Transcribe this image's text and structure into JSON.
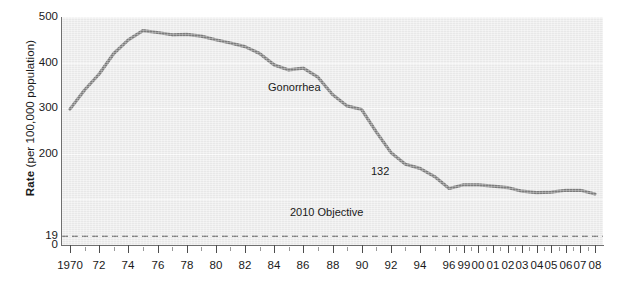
{
  "axes": {
    "y_title_bold": "Rate",
    "y_title_rest": " (per 100,000 population)"
  },
  "annotations": {
    "series_label": "Gonorrhea",
    "point_label": "132",
    "objective_label": "2010 Objective"
  },
  "colors": {
    "line": "#7d7d7d",
    "plot_background": "#eeeeee",
    "gridline": "#fbfbfb",
    "axis": "#6f6f6f",
    "text": "#1a1a1a",
    "objective_line": "#4d4d4d"
  },
  "chart_data": {
    "type": "line",
    "title": "",
    "xlabel": "",
    "ylabel": "Rate (per 100,000 population)",
    "ylim": [
      0,
      500
    ],
    "ytick_labels": [
      "500",
      "400",
      "300",
      "200",
      "19",
      "0"
    ],
    "ytick_values": [
      500,
      400,
      300,
      200,
      19,
      0
    ],
    "grid": true,
    "legend": "none",
    "xtick_labels": [
      "1970",
      "72",
      "74",
      "76",
      "78",
      "80",
      "82",
      "84",
      "86",
      "88",
      "90",
      "92",
      "94",
      "96",
      "99",
      "00",
      "01",
      "02",
      "03",
      "04",
      "05",
      "06",
      "07",
      "08"
    ],
    "x": [
      "1970",
      "1971",
      "1972",
      "1973",
      "1974",
      "1975",
      "1976",
      "1977",
      "1978",
      "1979",
      "1980",
      "1981",
      "1982",
      "1983",
      "1984",
      "1985",
      "1986",
      "1987",
      "1988",
      "1989",
      "1990",
      "1991",
      "1992",
      "1993",
      "1994",
      "1995",
      "1996",
      "1999",
      "2000",
      "2001",
      "2002",
      "2003",
      "2004",
      "2005",
      "2006",
      "2007",
      "2008"
    ],
    "series": [
      {
        "name": "Gonorrhea",
        "values": [
          298,
          340,
          375,
          420,
          450,
          470,
          466,
          461,
          462,
          458,
          450,
          443,
          435,
          420,
          395,
          384,
          388,
          368,
          330,
          305,
          297,
          248,
          203,
          177,
          168,
          150,
          124,
          132,
          132,
          129,
          126,
          118,
          115,
          116,
          120,
          120,
          112
        ]
      }
    ],
    "reference_line": {
      "label": "2010 Objective",
      "value": 19,
      "style": "dashed"
    },
    "data_labels": [
      {
        "label": "132",
        "year": "1999",
        "value": 132
      }
    ]
  }
}
